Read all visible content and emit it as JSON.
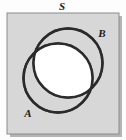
{
  "figure": {
    "type": "venn-diagram",
    "title_label": "S",
    "universe": {
      "label": "S",
      "label_x": 62,
      "label_y": 10,
      "rect": {
        "x": 7,
        "y": 13,
        "width": 112,
        "height": 121
      },
      "fill_color": "#d7d7d7",
      "border_color": "#8c8c8c",
      "shadow_color": "#b4b4b4"
    },
    "circles": [
      {
        "label": "A",
        "cx": 58,
        "cy": 78,
        "r": 34.5,
        "stroke_color": "#2b2b2b",
        "stroke_width": 2.4,
        "label_x": 28,
        "label_y": 117
      },
      {
        "label": "B",
        "cx": 68,
        "cy": 63,
        "r": 34.5,
        "stroke_color": "#2b2b2b",
        "stroke_width": 2.4,
        "label_x": 102,
        "label_y": 37
      }
    ],
    "intersection": {
      "label": "A ∩ B",
      "fill_color": "#ffffff",
      "shaded": true
    },
    "background_color": "#fdfdfd"
  }
}
